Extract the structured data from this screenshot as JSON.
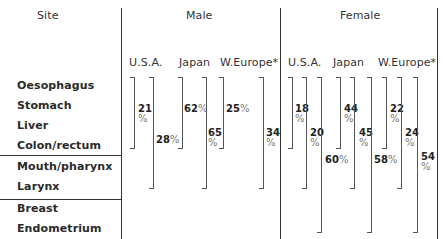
{
  "headers": {
    "site": "Site",
    "male": "Male",
    "female": "Female",
    "male_regions": [
      "U.S.A.",
      "Japan",
      "W.Europe*"
    ],
    "female_regions": [
      "U.S.A.",
      "Japan",
      "W.Europe*"
    ]
  },
  "sites": [
    "Oesophagus",
    "Stomach",
    "Liver",
    "Colon/rectum",
    "Mouth/pharynx",
    "Larynx",
    "Breast",
    "Endometrium"
  ],
  "brackets": [
    {
      "group": "Male",
      "region": "U.S.A.",
      "value": "21",
      "unit": "%",
      "covers_sites": 4
    },
    {
      "group": "Male",
      "region": "U.S.A.",
      "value": "28",
      "unit": "%",
      "covers_sites": 6
    },
    {
      "group": "Male",
      "region": "Japan",
      "value": "62",
      "unit": "%",
      "covers_sites": 4
    },
    {
      "group": "Male",
      "region": "Japan",
      "value": "65",
      "unit": "%",
      "covers_sites": 6
    },
    {
      "group": "Male",
      "region": "W.Europe*",
      "value": "25",
      "unit": "%",
      "covers_sites": 4
    },
    {
      "group": "Male",
      "region": "W.Europe*",
      "value": "34",
      "unit": "%",
      "covers_sites": 6
    },
    {
      "group": "Female",
      "region": "U.S.A.",
      "value": "18",
      "unit": "%",
      "covers_sites": 4
    },
    {
      "group": "Female",
      "region": "U.S.A.",
      "value": "20",
      "unit": "%",
      "covers_sites": 6
    },
    {
      "group": "Female",
      "region": "U.S.A.",
      "value": "60",
      "unit": "%",
      "covers_sites": 8
    },
    {
      "group": "Female",
      "region": "Japan",
      "value": "44",
      "unit": "%",
      "covers_sites": 4
    },
    {
      "group": "Female",
      "region": "Japan",
      "value": "45",
      "unit": "%",
      "covers_sites": 6
    },
    {
      "group": "Female",
      "region": "Japan",
      "value": "58",
      "unit": "%",
      "covers_sites": 8
    },
    {
      "group": "Female",
      "region": "W.Europe*",
      "value": "22",
      "unit": "%",
      "covers_sites": 4
    },
    {
      "group": "Female",
      "region": "W.Europe*",
      "value": "24",
      "unit": "%",
      "covers_sites": 6
    },
    {
      "group": "Female",
      "region": "W.Europe*",
      "value": "54",
      "unit": "%",
      "covers_sites": 8
    }
  ]
}
